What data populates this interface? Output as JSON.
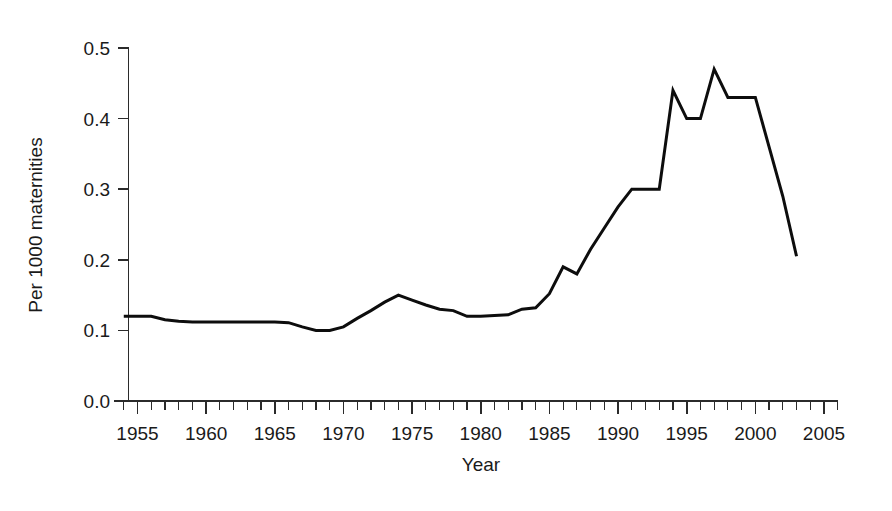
{
  "chart_data": {
    "type": "line",
    "title": "",
    "subtitle": "",
    "xlabel": "Year",
    "ylabel": "Per 1000 maternities",
    "xlim": [
      1952,
      2006
    ],
    "ylim": [
      0.0,
      0.5
    ],
    "grid": false,
    "legend": null,
    "legend_position": "none",
    "line_color": "#0d0d0d",
    "x_ticks_major": [
      1955,
      1960,
      1965,
      1970,
      1975,
      1980,
      1985,
      1990,
      1995,
      2000,
      2005
    ],
    "x_tick_labels": [
      "1955",
      "1960",
      "1965",
      "1970",
      "1975",
      "1980",
      "1985",
      "1990",
      "1995",
      "2000",
      "2005"
    ],
    "x_minor_tick_step": 1,
    "y_ticks": [
      0.0,
      0.1,
      0.2,
      0.3,
      0.4,
      0.5
    ],
    "y_tick_labels": [
      "0.0",
      "0.1",
      "0.2",
      "0.3",
      "0.4",
      "0.5"
    ],
    "series": [
      {
        "name": "Rate per 1000 maternities",
        "x": [
          1954,
          1955,
          1956,
          1957,
          1958,
          1959,
          1960,
          1961,
          1962,
          1963,
          1964,
          1965,
          1966,
          1967,
          1968,
          1969,
          1970,
          1971,
          1972,
          1973,
          1974,
          1975,
          1976,
          1977,
          1978,
          1979,
          1980,
          1981,
          1982,
          1983,
          1984,
          1985,
          1986,
          1987,
          1988,
          1989,
          1990,
          1991,
          1992,
          1993,
          1994,
          1995,
          1996,
          1997,
          1998,
          1999,
          2000,
          2001,
          2002,
          2003
        ],
        "values": [
          0.12,
          0.12,
          0.12,
          0.115,
          0.113,
          0.112,
          0.112,
          0.112,
          0.112,
          0.112,
          0.112,
          0.112,
          0.111,
          0.105,
          0.1,
          0.1,
          0.105,
          0.117,
          0.128,
          0.14,
          0.15,
          0.143,
          0.136,
          0.13,
          0.128,
          0.12,
          0.12,
          0.121,
          0.122,
          0.13,
          0.132,
          0.152,
          0.19,
          0.18,
          0.215,
          0.245,
          0.275,
          0.3,
          0.3,
          0.3,
          0.44,
          0.4,
          0.4,
          0.47,
          0.43,
          0.43,
          0.43,
          0.36,
          0.29,
          0.205
        ]
      }
    ],
    "notes": {
      "peak_1": {
        "year": 1997,
        "value": 0.47
      },
      "peak_2": {
        "year": 1994,
        "value": 0.44
      },
      "minimum": {
        "year": 1968,
        "value": 0.1
      },
      "final": {
        "year": 2003,
        "value": 0.205
      }
    }
  }
}
